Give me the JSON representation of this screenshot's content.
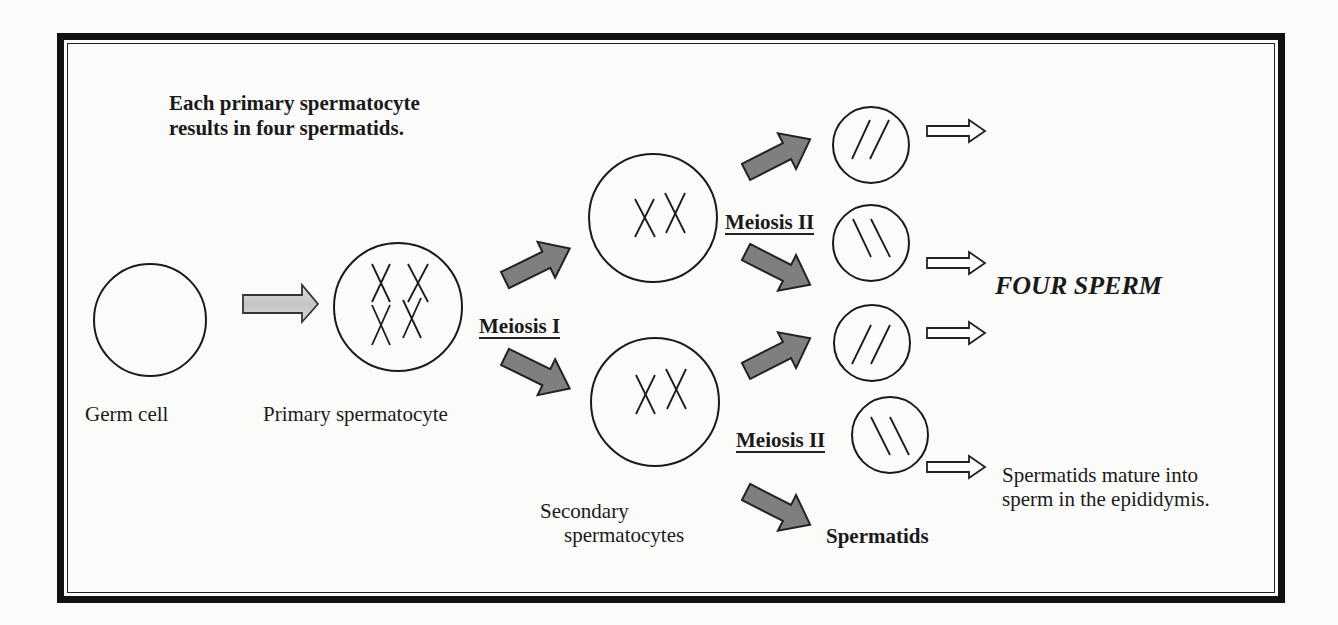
{
  "diagram": {
    "title": "Each primary spermatocyte results in four spermatids.",
    "heading_lines": [
      "Each primary spermatocyte",
      "results in four spermatids."
    ],
    "labels": {
      "germ_cell": "Germ cell",
      "primary_spermatocyte": "Primary spermatocyte",
      "meiosis_1": "Meiosis I",
      "meiosis_2_upper": "Meiosis II",
      "meiosis_2_lower": "Meiosis II",
      "secondary_line1": "Secondary",
      "secondary_line2": "spermatocytes",
      "spermatids": "Spermatids",
      "four_sperm": "FOUR SPERM",
      "mature_line1": "Spermatids mature into",
      "mature_line2": "sperm in the epididymis."
    },
    "stages": [
      {
        "name": "Germ cell",
        "count": 1,
        "chromosome_glyph": "none"
      },
      {
        "name": "Primary spermatocyte",
        "count": 1,
        "chromosome_glyph": "two pairs of crossed X (tetrads)"
      },
      {
        "name": "Secondary spermatocytes",
        "count": 2,
        "chromosome_glyph": "XX"
      },
      {
        "name": "Spermatids",
        "count": 4,
        "chromosome_glyph": [
          "//",
          "\\\\",
          "//",
          "\\\\"
        ]
      },
      {
        "name": "Sperm",
        "count": 4
      }
    ],
    "colors": {
      "frame": "#111111",
      "stroke": "#1a1a1a",
      "light_arrow_fill": "#cfcfcf",
      "dark_arrow_fill": "#7f7f7f",
      "hollow_arrow_fill": "#ffffff",
      "background": "#fbfbfa"
    }
  }
}
